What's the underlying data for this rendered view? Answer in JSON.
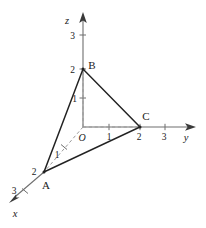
{
  "figure": {
    "type": "3d-coordinate-diagram",
    "background_color": "#ffffff",
    "line_color": "#222222",
    "axis_color": "#6e6e6e",
    "dashed_color": "#9a9a9a"
  },
  "axes": {
    "z": {
      "label": "z",
      "origin_px": {
        "x": 83,
        "y": 127
      },
      "arrow_tip_px": {
        "x": 83,
        "y": 13
      },
      "label_px": {
        "x": 70,
        "y": 20
      },
      "ticks": [
        {
          "value": "3",
          "px": {
            "x": 83,
            "y": 35
          },
          "label_px": {
            "x": 71,
            "y": 38
          }
        },
        {
          "value": "2",
          "px": {
            "x": 83,
            "y": 69
          },
          "label_px": {
            "x": 71,
            "y": 72
          }
        },
        {
          "value": "1",
          "px": {
            "x": 83,
            "y": 98
          },
          "label_px": {
            "x": 72,
            "y": 101
          }
        }
      ]
    },
    "y": {
      "label": "y",
      "origin_px": {
        "x": 83,
        "y": 127
      },
      "arrow_tip_px": {
        "x": 195,
        "y": 127
      },
      "label_px": {
        "x": 185,
        "y": 138
      },
      "ticks": [
        {
          "value": "1",
          "px": {
            "x": 109,
            "y": 127
          },
          "label_px": {
            "x": 106,
            "y": 138
          }
        },
        {
          "value": "2",
          "px": {
            "x": 140,
            "y": 127
          },
          "label_px": {
            "x": 136,
            "y": 138
          }
        },
        {
          "value": "3",
          "px": {
            "x": 165,
            "y": 127
          },
          "label_px": {
            "x": 161,
            "y": 138
          }
        }
      ]
    },
    "x": {
      "label": "x",
      "origin_px": {
        "x": 83,
        "y": 127
      },
      "arrow_tip_px": {
        "x": 10,
        "y": 201
      },
      "label_px": {
        "x": 12,
        "y": 215
      },
      "ticks": [
        {
          "value": "1",
          "px": {
            "x": 64,
            "y": 147
          },
          "label_px": {
            "x": 54,
            "y": 156
          }
        },
        {
          "value": "2",
          "px": {
            "x": 44,
            "y": 172
          },
          "label_px": {
            "x": 31,
            "y": 174
          }
        },
        {
          "value": "3",
          "px": {
            "x": 25,
            "y": 191
          },
          "label_px": {
            "x": 11,
            "y": 193
          }
        }
      ]
    }
  },
  "origin": {
    "label": "O",
    "label_px": {
      "x": 79,
      "y": 139
    }
  },
  "points": [
    {
      "name": "A",
      "label": "A",
      "px": {
        "x": 44,
        "y": 172
      },
      "label_px": {
        "x": 44,
        "y": 187
      },
      "coords": "(2, 0, 0)"
    },
    {
      "name": "B",
      "label": "B",
      "px": {
        "x": 83,
        "y": 69
      },
      "label_px": {
        "x": 89,
        "y": 68
      },
      "coords": "(0, 0, 2)"
    },
    {
      "name": "C",
      "label": "C",
      "px": {
        "x": 140,
        "y": 127
      },
      "label_px": {
        "x": 143,
        "y": 120
      },
      "coords": "(0, 2, 0)"
    }
  ],
  "triangle_edges": [
    {
      "from": "A",
      "to": "B"
    },
    {
      "from": "B",
      "to": "C"
    },
    {
      "from": "C",
      "to": "A"
    }
  ],
  "dashed_segments": [
    {
      "from": "O",
      "to": "B",
      "note": "vertical projection line on z-axis"
    },
    {
      "from": "O",
      "to": "A",
      "note": "x-axis segment under triangle"
    },
    {
      "from": "O",
      "to": "C",
      "note": "y-axis segment under triangle"
    }
  ]
}
